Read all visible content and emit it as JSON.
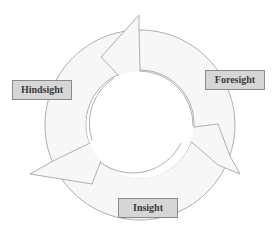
{
  "diagram": {
    "type": "cycle",
    "nodes": [
      {
        "id": "hindsight",
        "label": "Hindsight"
      },
      {
        "id": "foresight",
        "label": "Foresight"
      },
      {
        "id": "insight",
        "label": "Insight"
      }
    ],
    "colors": {
      "ring_fill": "#f7f7f7",
      "ring_stroke": "#9a9a9a",
      "label_fill": "#d6d6d6",
      "label_border": "#8a8a8a",
      "label_text": "#3a3a3a"
    }
  }
}
